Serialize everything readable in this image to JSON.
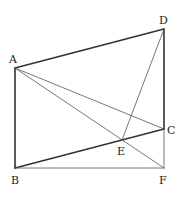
{
  "diagram": {
    "points": {
      "A": {
        "label": "A",
        "x": 15,
        "y": 68,
        "lx": 9,
        "ly": 63
      },
      "B": {
        "label": "B",
        "x": 15,
        "y": 168,
        "lx": 11,
        "ly": 184
      },
      "C": {
        "label": "C",
        "x": 164,
        "y": 129,
        "lx": 167,
        "ly": 134
      },
      "D": {
        "label": "D",
        "x": 164,
        "y": 29,
        "lx": 159,
        "ly": 24
      },
      "E": {
        "label": "E",
        "x": 122,
        "y": 140,
        "lx": 117,
        "ly": 155
      },
      "F": {
        "label": "F",
        "x": 164,
        "y": 168,
        "lx": 159,
        "ly": 184
      }
    },
    "segments": [
      {
        "from": "A",
        "to": "D",
        "weight": "thick"
      },
      {
        "from": "A",
        "to": "B",
        "weight": "thick"
      },
      {
        "from": "B",
        "to": "C",
        "weight": "thick"
      },
      {
        "from": "D",
        "to": "C",
        "weight": "thick"
      },
      {
        "from": "A",
        "to": "C",
        "weight": "thin"
      },
      {
        "from": "A",
        "to": "F",
        "weight": "thin"
      },
      {
        "from": "D",
        "to": "E",
        "weight": "thin"
      },
      {
        "from": "B",
        "to": "F",
        "weight": "thin"
      },
      {
        "from": "C",
        "to": "F",
        "weight": "thin"
      }
    ],
    "colors": {
      "stroke": "#333333",
      "thin_stroke": "#555555"
    }
  }
}
